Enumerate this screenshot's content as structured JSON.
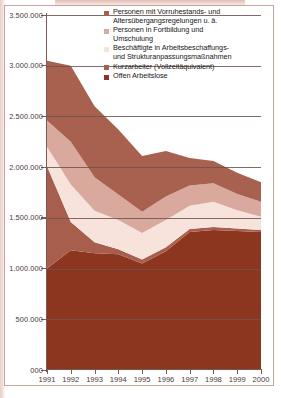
{
  "chart_data": {
    "type": "area",
    "stacked": true,
    "title": "",
    "subtitle": "",
    "xlabel": "",
    "ylabel": "",
    "grid": true,
    "legend_position": "top-right",
    "x": [
      1991,
      1992,
      1993,
      1994,
      1995,
      1996,
      1997,
      1998,
      1999,
      2000
    ],
    "categories": [
      "1991",
      "1992",
      "1993",
      "1994",
      "1995",
      "1996",
      "1997",
      "1998",
      "1999",
      "2000"
    ],
    "xtick_labels": [
      "1991",
      "1992",
      "1993",
      "1994",
      "1995",
      "1996",
      "1997",
      "1998",
      "1999",
      "2000"
    ],
    "ytick_labels": [
      "000",
      "500.000",
      "1.000.000",
      "1.500.000",
      "2.000.000",
      "2.500.000",
      "3.000.000",
      "3.500.000"
    ],
    "ytick_values": [
      0,
      500000,
      1000000,
      1500000,
      2000000,
      2500000,
      3000000,
      3500000
    ],
    "ylim": [
      0,
      3500000
    ],
    "xlim": [
      1991,
      2000
    ],
    "series": [
      {
        "name": "Offen Arbeitslose",
        "color": "#8c3620",
        "values": [
          1000000,
          1180000,
          1150000,
          1140000,
          1050000,
          1170000,
          1360000,
          1380000,
          1370000,
          1360000
        ]
      },
      {
        "name": "Kurzarbeiter (Vollzeitäquivalent)",
        "color": "#a85e4c",
        "values": [
          1010000,
          280000,
          110000,
          50000,
          40000,
          40000,
          30000,
          30000,
          25000,
          20000
        ]
      },
      {
        "name": "Beschäftigte in Arbeitsbeschaffungs- und Strukturanpassungsmaßnahmen",
        "color": "#f7e3dc",
        "values": [
          190000,
          370000,
          310000,
          290000,
          260000,
          270000,
          230000,
          250000,
          180000,
          130000
        ]
      },
      {
        "name": "Personen in Fortbildung und Umschulung",
        "color": "#d9a99d",
        "values": [
          260000,
          420000,
          330000,
          250000,
          210000,
          230000,
          200000,
          180000,
          160000,
          150000
        ]
      },
      {
        "name": "Personen mit Vorruhestands- und Altersübergangsregelungen u. ä.",
        "color": "#a8614f",
        "values": [
          590000,
          750000,
          700000,
          640000,
          550000,
          450000,
          270000,
          220000,
          210000,
          190000
        ]
      }
    ]
  },
  "legend": {
    "items": [
      {
        "label_line1": "Personen mit Vorruhestands- und",
        "label_line2": "Altersübergangsregelungen u. ä.",
        "color": "#a8614f"
      },
      {
        "label_line1": "Personen in Fortbildung und",
        "label_line2": "Umschulung",
        "color": "#d9a99d"
      },
      {
        "label_line1": "Beschäftigte in Arbeitsbeschaffungs-",
        "label_line2": "und Strukturanpassungsmaßnahmen",
        "color": "#f7e3dc"
      },
      {
        "label_line1": "Kurzarbeiter (Vollzeitäquivalent)",
        "label_line2": "",
        "color": "#a85e4c"
      },
      {
        "label_line1": "Offen Arbeitslose",
        "label_line2": "",
        "color": "#8c3620"
      }
    ]
  },
  "colors": {
    "axis": "#7a5b55",
    "grid": "#6d524d",
    "text": "#201816",
    "frame": "#c9a79f",
    "background": "#ffffff"
  }
}
